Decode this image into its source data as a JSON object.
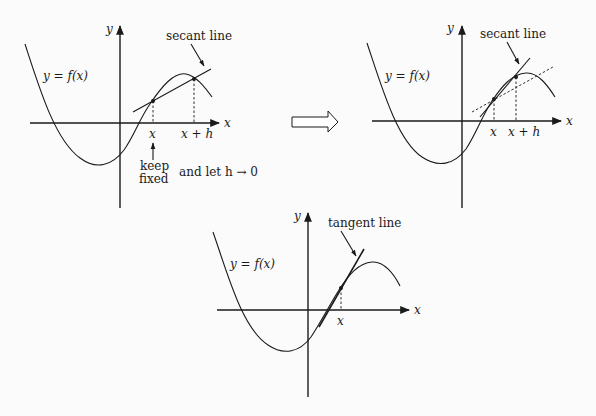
{
  "diagram": {
    "colors": {
      "ink": "#1a1a1a",
      "background": "#fbfbfb"
    },
    "panel1": {
      "y_axis_label": "y",
      "x_axis_label": "x",
      "function_label": "y = f(x)",
      "line_label": "secant line",
      "tick_x": "x",
      "tick_x_plus_h": "x + h",
      "note_keep": "keep",
      "note_fixed": "fixed",
      "note_let": "and let h → 0"
    },
    "transition_arrow": "right-hollow-arrow",
    "panel2": {
      "y_axis_label": "y",
      "x_axis_label": "x",
      "function_label": "y = f(x)",
      "line_label": "secant line",
      "tick_x": "x",
      "tick_x_plus_h": "x + h"
    },
    "panel3": {
      "y_axis_label": "y",
      "x_axis_label": "x",
      "function_label": "y = f(x)",
      "line_label": "tangent line",
      "tick_x": "x"
    }
  }
}
